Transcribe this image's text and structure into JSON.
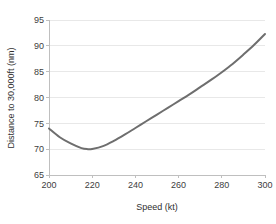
{
  "chart_data": {
    "type": "line",
    "title": "",
    "subtitle": "",
    "xlabel": "Speed (kt)",
    "ylabel": "Distance to 30,000ft (nm)",
    "xlim": [
      200,
      300
    ],
    "ylim": [
      65,
      95
    ],
    "xticks": [
      200,
      220,
      240,
      260,
      280,
      300
    ],
    "yticks": [
      65,
      70,
      75,
      80,
      85,
      90,
      95
    ],
    "xtick_labels": [
      "200",
      "220",
      "240",
      "260",
      "280",
      "300"
    ],
    "ytick_labels": [
      "65",
      "70",
      "75",
      "80",
      "85",
      "90",
      "95"
    ],
    "grid": {
      "horizontal": true,
      "vertical": false,
      "color": "#e8e8e8"
    },
    "legend": {
      "visible": false,
      "position": "none",
      "entries": []
    },
    "annotations": [],
    "line_color": "#6e6e6e",
    "line_width": 2,
    "axis_color": "#bfbfbf",
    "series": [
      {
        "name": "Distance to 30,000ft",
        "color": "#6e6e6e",
        "x": [
          200,
          205,
          210,
          215,
          218,
          220,
          225,
          230,
          235,
          240,
          245,
          250,
          255,
          260,
          265,
          270,
          275,
          280,
          285,
          290,
          295,
          300
        ],
        "y": [
          74.0,
          72.3,
          71.1,
          70.2,
          70.0,
          70.05,
          70.6,
          71.6,
          72.8,
          74.1,
          75.4,
          76.7,
          78.0,
          79.3,
          80.6,
          82.0,
          83.4,
          84.9,
          86.5,
          88.3,
          90.2,
          92.3
        ]
      }
    ]
  },
  "layout": {
    "plot_left": 49,
    "plot_right": 265,
    "plot_top": 20,
    "plot_bottom": 175
  }
}
